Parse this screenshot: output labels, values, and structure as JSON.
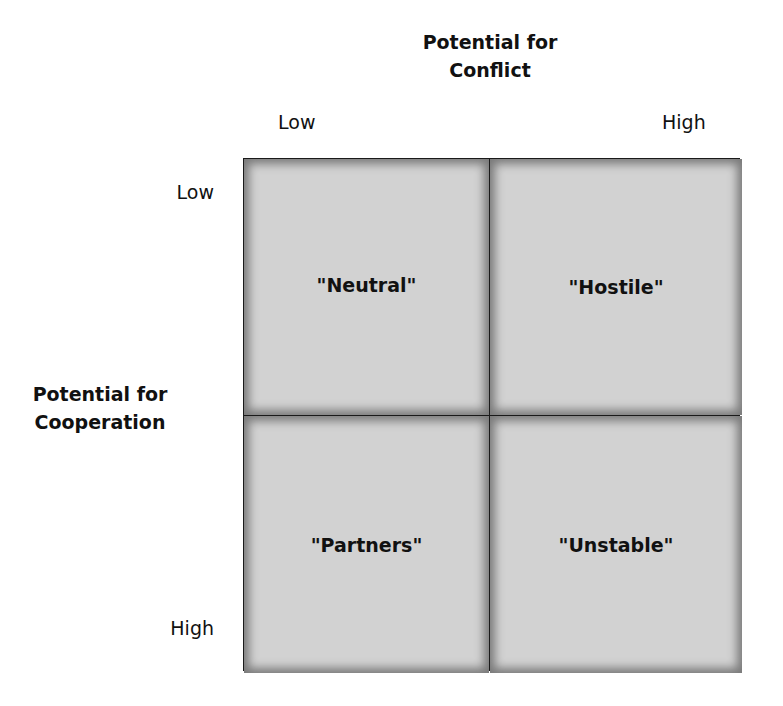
{
  "x_axis": {
    "title_line1": "Potential for",
    "title_line2": "Conflict",
    "low_label": "Low",
    "high_label": "High"
  },
  "y_axis": {
    "title_line1": "Potential for",
    "title_line2": "Cooperation",
    "low_label": "Low",
    "high_label": "High"
  },
  "quadrants": [
    {
      "position": "low-conflict / low-cooperation",
      "label": "\"Neutral\""
    },
    {
      "position": "high-conflict / low-cooperation",
      "label": "\"Hostile\""
    },
    {
      "position": "low-conflict / high-cooperation",
      "label": "\"Partners\""
    },
    {
      "position": "high-conflict / high-cooperation",
      "label": "\"Unstable\""
    }
  ],
  "colors": {
    "cell_fill": "#d2d2d2",
    "cell_shadow": "#7a7a7a",
    "border": "#1a1a1a",
    "text": "#111111"
  }
}
